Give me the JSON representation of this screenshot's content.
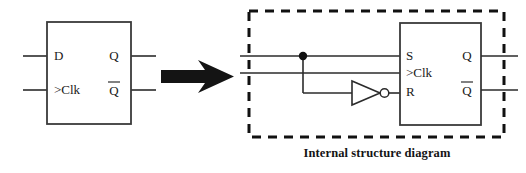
{
  "figure": {
    "caption": "Internal structure diagram",
    "colors": {
      "background": "#ffffff",
      "line": "#2b2b2b",
      "dashed_boundary": "#111111",
      "text": "#1a1a1a",
      "arrow": "#141414"
    }
  },
  "left_symbol": {
    "name": "d-flip-flop-symbol",
    "inputs": [
      {
        "label": "D",
        "pin": "data-input"
      },
      {
        "label": ">Clk",
        "pin": "clock-input"
      }
    ],
    "outputs": [
      {
        "label": "Q",
        "pin": "q-output",
        "overbar": false
      },
      {
        "label": "Q",
        "pin": "q-bar-output",
        "overbar": true
      }
    ]
  },
  "transform_arrow": {
    "name": "equivalence-arrow",
    "direction": "right"
  },
  "internal_structure": {
    "name": "sr-flip-flop-internal",
    "boundary": "dashed",
    "gate": {
      "type": "inverter",
      "label": "NOT"
    },
    "junction": {
      "label": "wire-junction-dot"
    },
    "inputs": [
      {
        "label": "S",
        "pin": "set-input"
      },
      {
        "label": ">Clk",
        "pin": "clock-input"
      },
      {
        "label": "R",
        "pin": "reset-input"
      }
    ],
    "outputs": [
      {
        "label": "Q",
        "pin": "q-output",
        "overbar": false
      },
      {
        "label": "Q",
        "pin": "q-bar-output",
        "overbar": true
      }
    ]
  }
}
